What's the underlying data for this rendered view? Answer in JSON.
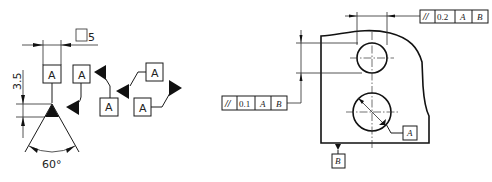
{
  "left_figure": {
    "title": "Datum feature symbol construction",
    "datum_letter": "A",
    "box_size_label": "□5",
    "height_label": "3.5",
    "angle_label": "60°",
    "variant_letters": [
      "A",
      "A",
      "A",
      "A"
    ]
  },
  "right_figure": {
    "top_frame": {
      "symbol": "//",
      "tolerance": "0.2",
      "datum_1": "A",
      "datum_2": "B"
    },
    "left_frame": {
      "symbol": "//",
      "tolerance": "0.1",
      "datum_1": "A",
      "datum_2": "B"
    },
    "datum_hole": "A",
    "datum_base": "B"
  },
  "colors": {
    "line": "#1a1a1a",
    "background": "#ffffff"
  }
}
